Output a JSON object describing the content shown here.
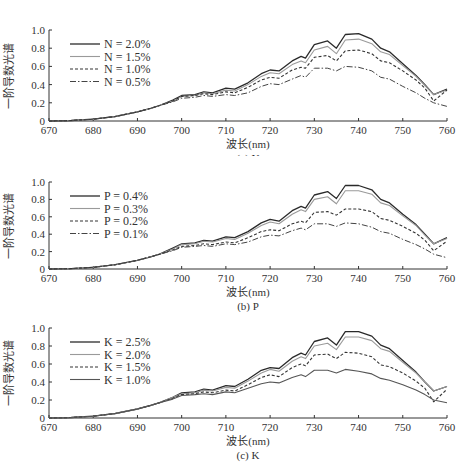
{
  "chart_data": [
    {
      "type": "line",
      "title": "(a) N",
      "xlabel": "波长(nm)",
      "ylabel": "一阶导数光谱",
      "xlim": [
        670,
        760
      ],
      "ylim": [
        0,
        1.0
      ],
      "xticks": [
        670,
        680,
        690,
        700,
        710,
        720,
        730,
        740,
        750,
        760
      ],
      "yticks": [
        "0",
        "0.2",
        "0.4",
        "0.6",
        "0.8",
        "1.0"
      ],
      "grid": false,
      "legend_position": "upper-left",
      "x": [
        670,
        675,
        680,
        685,
        690,
        693,
        695,
        698,
        700,
        703,
        705,
        707,
        710,
        712,
        715,
        718,
        720,
        722,
        725,
        727,
        728,
        730,
        733,
        735,
        737,
        740,
        743,
        745,
        747,
        750,
        753,
        755,
        757,
        760
      ],
      "series": [
        {
          "name": "N = 2.0%",
          "style": "solid-dark",
          "values": [
            0,
            0.005,
            0.02,
            0.05,
            0.1,
            0.14,
            0.17,
            0.23,
            0.28,
            0.29,
            0.32,
            0.31,
            0.36,
            0.35,
            0.42,
            0.52,
            0.56,
            0.55,
            0.66,
            0.71,
            0.69,
            0.84,
            0.88,
            0.8,
            0.95,
            0.96,
            0.9,
            0.8,
            0.76,
            0.63,
            0.5,
            0.4,
            0.29,
            0.35
          ]
        },
        {
          "name": "N = 1.5%",
          "style": "solid-light",
          "values": [
            0,
            0.005,
            0.02,
            0.05,
            0.1,
            0.14,
            0.17,
            0.22,
            0.27,
            0.28,
            0.31,
            0.3,
            0.34,
            0.33,
            0.4,
            0.49,
            0.53,
            0.52,
            0.62,
            0.66,
            0.64,
            0.78,
            0.82,
            0.74,
            0.89,
            0.9,
            0.85,
            0.76,
            0.73,
            0.61,
            0.49,
            0.39,
            0.29,
            0.34
          ]
        },
        {
          "name": "N = 1.0%",
          "style": "dashed",
          "values": [
            0,
            0.005,
            0.02,
            0.05,
            0.1,
            0.14,
            0.17,
            0.22,
            0.27,
            0.28,
            0.3,
            0.29,
            0.32,
            0.31,
            0.37,
            0.45,
            0.48,
            0.47,
            0.56,
            0.59,
            0.58,
            0.7,
            0.72,
            0.66,
            0.77,
            0.78,
            0.74,
            0.66,
            0.64,
            0.55,
            0.45,
            0.36,
            0.22,
            0.34
          ]
        },
        {
          "name": "N = 0.5%",
          "style": "dash-dot",
          "values": [
            0,
            0.005,
            0.02,
            0.05,
            0.1,
            0.14,
            0.17,
            0.21,
            0.25,
            0.26,
            0.28,
            0.27,
            0.29,
            0.28,
            0.31,
            0.38,
            0.41,
            0.4,
            0.46,
            0.5,
            0.48,
            0.58,
            0.58,
            0.55,
            0.6,
            0.59,
            0.55,
            0.48,
            0.46,
            0.38,
            0.31,
            0.25,
            0.2,
            0.16
          ]
        }
      ]
    },
    {
      "type": "line",
      "title": "(b) P",
      "xlabel": "波长(nm)",
      "ylabel": "一阶导数光谱",
      "xlim": [
        670,
        760
      ],
      "ylim": [
        0,
        1.0
      ],
      "xticks": [
        670,
        680,
        690,
        700,
        710,
        720,
        730,
        740,
        750,
        760
      ],
      "yticks": [
        "0",
        "0.2",
        "0.4",
        "0.6",
        "0.8",
        "1.0"
      ],
      "grid": false,
      "legend_position": "upper-left",
      "x": [
        670,
        675,
        680,
        685,
        690,
        693,
        695,
        698,
        700,
        703,
        705,
        707,
        710,
        712,
        715,
        718,
        720,
        722,
        725,
        727,
        728,
        730,
        733,
        735,
        737,
        740,
        743,
        745,
        747,
        750,
        753,
        755,
        757,
        760
      ],
      "series": [
        {
          "name": "P = 0.4%",
          "style": "solid-dark",
          "values": [
            0,
            0.005,
            0.02,
            0.05,
            0.1,
            0.14,
            0.17,
            0.24,
            0.29,
            0.3,
            0.33,
            0.32,
            0.37,
            0.36,
            0.43,
            0.53,
            0.57,
            0.55,
            0.67,
            0.72,
            0.7,
            0.85,
            0.89,
            0.81,
            0.96,
            0.96,
            0.91,
            0.8,
            0.76,
            0.63,
            0.51,
            0.4,
            0.29,
            0.36
          ]
        },
        {
          "name": "P = 0.3%",
          "style": "solid-light",
          "values": [
            0,
            0.005,
            0.02,
            0.05,
            0.1,
            0.14,
            0.17,
            0.23,
            0.28,
            0.29,
            0.32,
            0.31,
            0.35,
            0.34,
            0.41,
            0.5,
            0.54,
            0.52,
            0.63,
            0.68,
            0.66,
            0.8,
            0.83,
            0.75,
            0.9,
            0.9,
            0.86,
            0.76,
            0.73,
            0.61,
            0.5,
            0.39,
            0.29,
            0.35
          ]
        },
        {
          "name": "P = 0.2%",
          "style": "dashed",
          "values": [
            0,
            0.005,
            0.02,
            0.05,
            0.1,
            0.14,
            0.17,
            0.22,
            0.26,
            0.27,
            0.29,
            0.28,
            0.31,
            0.3,
            0.36,
            0.43,
            0.45,
            0.44,
            0.52,
            0.55,
            0.53,
            0.65,
            0.66,
            0.62,
            0.69,
            0.69,
            0.66,
            0.58,
            0.56,
            0.49,
            0.41,
            0.33,
            0.21,
            0.32
          ]
        },
        {
          "name": "P = 0.1%",
          "style": "dash-dot",
          "values": [
            0,
            0.005,
            0.02,
            0.05,
            0.1,
            0.14,
            0.17,
            0.21,
            0.25,
            0.26,
            0.27,
            0.26,
            0.29,
            0.28,
            0.31,
            0.37,
            0.39,
            0.38,
            0.44,
            0.47,
            0.45,
            0.52,
            0.52,
            0.49,
            0.53,
            0.52,
            0.48,
            0.43,
            0.41,
            0.34,
            0.28,
            0.23,
            0.17,
            0.13
          ]
        }
      ]
    },
    {
      "type": "line",
      "title": "(c) K",
      "xlabel": "波长(nm)",
      "ylabel": "一阶导数光谱",
      "xlim": [
        670,
        760
      ],
      "ylim": [
        0,
        1.0
      ],
      "xticks": [
        670,
        680,
        690,
        700,
        710,
        720,
        730,
        740,
        750,
        760
      ],
      "yticks": [
        "0",
        "0.2",
        "0.4",
        "0.6",
        "0.8",
        "1.0"
      ],
      "grid": false,
      "legend_position": "upper-left",
      "x": [
        670,
        675,
        680,
        685,
        690,
        693,
        695,
        698,
        700,
        703,
        705,
        707,
        710,
        712,
        715,
        718,
        720,
        722,
        725,
        727,
        728,
        730,
        733,
        735,
        737,
        740,
        743,
        745,
        747,
        750,
        753,
        755,
        757,
        760
      ],
      "series": [
        {
          "name": "K = 2.5%",
          "style": "solid-dark",
          "values": [
            0,
            0.005,
            0.02,
            0.05,
            0.1,
            0.14,
            0.17,
            0.23,
            0.28,
            0.29,
            0.32,
            0.31,
            0.36,
            0.35,
            0.43,
            0.53,
            0.56,
            0.55,
            0.67,
            0.72,
            0.7,
            0.85,
            0.89,
            0.81,
            0.96,
            0.96,
            0.91,
            0.81,
            0.77,
            0.64,
            0.51,
            0.4,
            0.3,
            0.35
          ]
        },
        {
          "name": "K = 2.0%",
          "style": "solid-light",
          "values": [
            0,
            0.005,
            0.02,
            0.05,
            0.1,
            0.14,
            0.17,
            0.23,
            0.27,
            0.28,
            0.31,
            0.3,
            0.34,
            0.33,
            0.41,
            0.5,
            0.54,
            0.52,
            0.63,
            0.68,
            0.66,
            0.8,
            0.83,
            0.76,
            0.9,
            0.9,
            0.86,
            0.77,
            0.74,
            0.62,
            0.5,
            0.4,
            0.3,
            0.35
          ]
        },
        {
          "name": "K = 1.5%",
          "style": "dashed",
          "values": [
            0,
            0.005,
            0.02,
            0.05,
            0.1,
            0.14,
            0.17,
            0.22,
            0.26,
            0.27,
            0.29,
            0.28,
            0.31,
            0.3,
            0.37,
            0.45,
            0.48,
            0.46,
            0.56,
            0.6,
            0.58,
            0.7,
            0.71,
            0.66,
            0.73,
            0.72,
            0.68,
            0.59,
            0.57,
            0.5,
            0.41,
            0.33,
            0.18,
            0.32
          ]
        },
        {
          "name": "K = 1.0%",
          "style": "solid-medium",
          "values": [
            0,
            0.005,
            0.02,
            0.05,
            0.1,
            0.14,
            0.17,
            0.21,
            0.25,
            0.26,
            0.27,
            0.26,
            0.29,
            0.28,
            0.33,
            0.38,
            0.4,
            0.39,
            0.45,
            0.48,
            0.46,
            0.53,
            0.53,
            0.5,
            0.54,
            0.52,
            0.49,
            0.44,
            0.42,
            0.37,
            0.31,
            0.26,
            0.2,
            0.17
          ]
        }
      ]
    }
  ],
  "panels": [
    {
      "caption": "(a) N",
      "xlabel": "波长(nm)",
      "ylabel": "一阶导数光谱"
    },
    {
      "caption": "(b) P",
      "xlabel": "波长(nm)",
      "ylabel": "一阶导数光谱"
    },
    {
      "caption": "(c) K",
      "xlabel": "波长(nm)",
      "ylabel": "一阶导数光谱"
    }
  ],
  "style": {
    "solid-dark": {
      "color": "#2a2a2a",
      "dash": "",
      "width": 1.3
    },
    "solid-light": {
      "color": "#9a9a9a",
      "dash": "",
      "width": 1.1
    },
    "solid-medium": {
      "color": "#555555",
      "dash": "",
      "width": 1.1
    },
    "dashed": {
      "color": "#333333",
      "dash": "3,2",
      "width": 1.1
    },
    "dash-dot": {
      "color": "#444444",
      "dash": "6,2,1.5,2",
      "width": 1.0
    }
  }
}
